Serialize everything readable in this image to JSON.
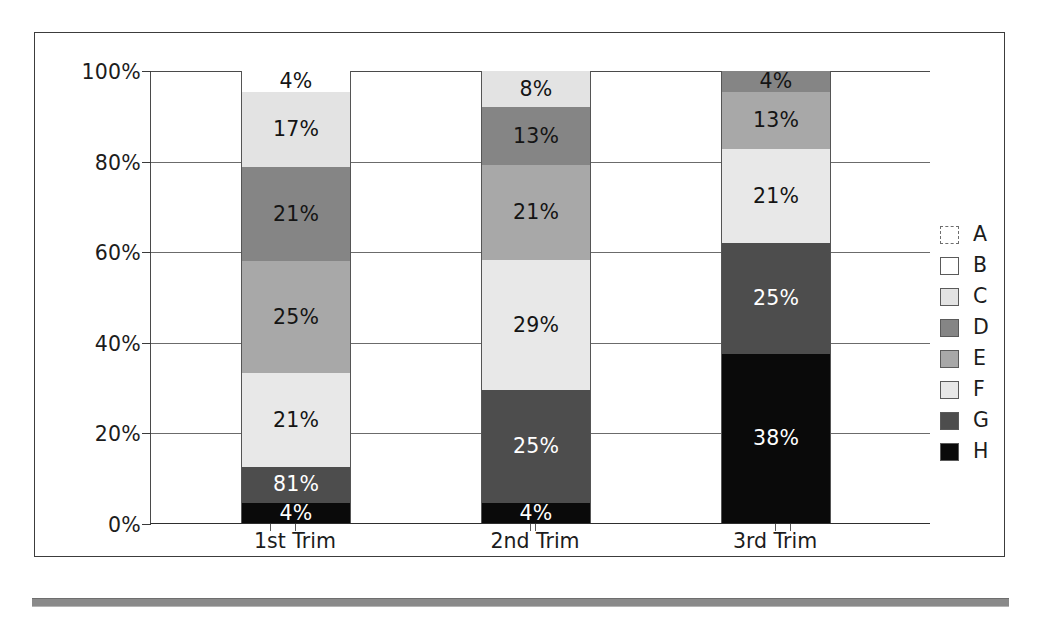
{
  "chart_data": {
    "type": "bar",
    "subtype": "100% stacked bar",
    "title": "",
    "xlabel": "",
    "ylabel": "",
    "ylim": [
      0,
      100
    ],
    "ytick_labels": [
      "0%",
      "20%",
      "40%",
      "60%",
      "80%",
      "100%"
    ],
    "ytick_values": [
      0,
      20,
      40,
      60,
      80,
      100
    ],
    "grid": true,
    "legend_position": "right",
    "categories": [
      "1st Trim",
      "2nd Trim",
      "3rd Trim"
    ],
    "series": [
      {
        "name": "A",
        "color": "#ffffff",
        "values": [
          0,
          0,
          0
        ],
        "labels": [
          "",
          "",
          ""
        ]
      },
      {
        "name": "B",
        "color": "#ffffff",
        "values": [
          4,
          0,
          0
        ],
        "labels": [
          "4%",
          "",
          ""
        ]
      },
      {
        "name": "C",
        "color": "#e3e3e3",
        "values": [
          17,
          8,
          0
        ],
        "labels": [
          "17%",
          "8%",
          ""
        ]
      },
      {
        "name": "D",
        "color": "#858585",
        "values": [
          21,
          13,
          4
        ],
        "labels": [
          "21%",
          "13%",
          "4%"
        ]
      },
      {
        "name": "E",
        "color": "#a8a8a8",
        "values": [
          25,
          21,
          13
        ],
        "labels": [
          "25%",
          "21%",
          "13%"
        ]
      },
      {
        "name": "F",
        "color": "#e8e8e8",
        "values": [
          21,
          29,
          21
        ],
        "labels": [
          "21%",
          "29%",
          "21%"
        ]
      },
      {
        "name": "G",
        "color": "#4d4d4d",
        "values": [
          8,
          25,
          25
        ],
        "labels": [
          "81%",
          "25%",
          "25%"
        ]
      },
      {
        "name": "H",
        "color": "#0a0a0a",
        "values": [
          4,
          4,
          38
        ],
        "labels": [
          "4%",
          "4%",
          "38%"
        ]
      }
    ]
  },
  "legend": {
    "items": [
      {
        "label": "A",
        "color": "#ffffff",
        "style": "dashed"
      },
      {
        "label": "B",
        "color": "#ffffff",
        "style": "solid"
      },
      {
        "label": "C",
        "color": "#e3e3e3",
        "style": "solid"
      },
      {
        "label": "D",
        "color": "#858585",
        "style": "solid"
      },
      {
        "label": "E",
        "color": "#a8a8a8",
        "style": "solid"
      },
      {
        "label": "F",
        "color": "#e8e8e8",
        "style": "solid"
      },
      {
        "label": "G",
        "color": "#4d4d4d",
        "style": "solid"
      },
      {
        "label": "H",
        "color": "#0a0a0a",
        "style": "solid"
      }
    ]
  },
  "bars": [
    {
      "category": "1st Trim",
      "segments": [
        {
          "series": "B",
          "value": 4,
          "label": "4%",
          "color": "#ffffff",
          "text": "dark"
        },
        {
          "series": "C",
          "value": 17,
          "label": "17%",
          "color": "#e3e3e3",
          "text": "dark"
        },
        {
          "series": "D",
          "value": 21,
          "label": "21%",
          "color": "#858585",
          "text": "dark"
        },
        {
          "series": "E",
          "value": 25,
          "label": "25%",
          "color": "#a8a8a8",
          "text": "dark"
        },
        {
          "series": "F",
          "value": 21,
          "label": "21%",
          "color": "#e8e8e8",
          "text": "dark"
        },
        {
          "series": "G",
          "value": 8,
          "label": "81%",
          "color": "#4d4d4d",
          "text": "light"
        },
        {
          "series": "H",
          "value": 4,
          "label": "4%",
          "color": "#0a0a0a",
          "text": "light"
        }
      ]
    },
    {
      "category": "2nd Trim",
      "segments": [
        {
          "series": "C",
          "value": 8,
          "label": "8%",
          "color": "#e3e3e3",
          "text": "dark"
        },
        {
          "series": "D",
          "value": 13,
          "label": "13%",
          "color": "#858585",
          "text": "dark"
        },
        {
          "series": "E",
          "value": 21,
          "label": "21%",
          "color": "#a8a8a8",
          "text": "dark"
        },
        {
          "series": "F",
          "value": 29,
          "label": "29%",
          "color": "#e8e8e8",
          "text": "dark"
        },
        {
          "series": "G",
          "value": 25,
          "label": "25%",
          "color": "#4d4d4d",
          "text": "light"
        },
        {
          "series": "H",
          "value": 4,
          "label": "4%",
          "color": "#0a0a0a",
          "text": "light"
        }
      ]
    },
    {
      "category": "3rd Trim",
      "segments": [
        {
          "series": "D",
          "value": 4,
          "label": "4%",
          "color": "#858585",
          "text": "dark"
        },
        {
          "series": "E",
          "value": 13,
          "label": "13%",
          "color": "#a8a8a8",
          "text": "dark"
        },
        {
          "series": "F",
          "value": 21,
          "label": "21%",
          "color": "#e8e8e8",
          "text": "dark"
        },
        {
          "series": "G",
          "value": 25,
          "label": "25%",
          "color": "#4d4d4d",
          "text": "light"
        },
        {
          "series": "H",
          "value": 38,
          "label": "38%",
          "color": "#0a0a0a",
          "text": "light"
        }
      ]
    }
  ]
}
